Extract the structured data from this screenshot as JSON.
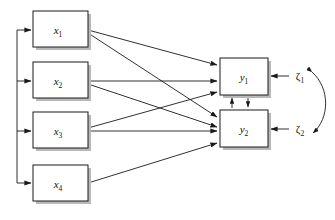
{
  "diagram": {
    "type": "path-diagram",
    "background_color": "#ffffff",
    "line_color": "#1a1a1a",
    "box_fill": "#ffffff",
    "shadow_color": "#b9b9b9"
  },
  "exogenous": {
    "group_label": "exogenous-variables",
    "nodes": [
      {
        "id": "x1",
        "base": "x",
        "subscript": "1",
        "x": 33,
        "y": 11,
        "w": 55,
        "h": 36
      },
      {
        "id": "x2",
        "base": "x",
        "subscript": "2",
        "x": 33,
        "y": 62,
        "w": 55,
        "h": 36
      },
      {
        "id": "x3",
        "base": "x",
        "subscript": "3",
        "x": 33,
        "y": 112,
        "w": 55,
        "h": 36
      },
      {
        "id": "x4",
        "base": "x",
        "subscript": "4",
        "x": 33,
        "y": 165,
        "w": 55,
        "h": 36
      }
    ]
  },
  "endogenous": {
    "group_label": "endogenous-variables",
    "nodes": [
      {
        "id": "y1",
        "base": "y",
        "subscript": "1",
        "x": 220,
        "y": 58,
        "w": 48,
        "h": 37
      },
      {
        "id": "y2",
        "base": "y",
        "subscript": "2",
        "x": 220,
        "y": 110,
        "w": 48,
        "h": 37
      }
    ]
  },
  "disturbances": {
    "group_label": "disturbance-terms",
    "nodes": [
      {
        "id": "zeta1",
        "base": "ζ",
        "subscript": "1",
        "label": "ζ1",
        "x": 300,
        "y": 76
      },
      {
        "id": "zeta2",
        "base": "ζ",
        "subscript": "2",
        "label": "ζ2",
        "x": 300,
        "y": 129
      }
    ]
  },
  "paths": {
    "group_label": "directed-paths",
    "directed": [
      {
        "from": "x1",
        "to": "y1"
      },
      {
        "from": "x1",
        "to": "y2"
      },
      {
        "from": "x2",
        "to": "y1"
      },
      {
        "from": "x2",
        "to": "y2"
      },
      {
        "from": "x3",
        "to": "y1"
      },
      {
        "from": "x3",
        "to": "y2"
      },
      {
        "from": "x4",
        "to": "y2"
      },
      {
        "from": "y1",
        "to": "y2"
      },
      {
        "from": "y2",
        "to": "y1"
      },
      {
        "from": "zeta1",
        "to": "y1"
      },
      {
        "from": "zeta2",
        "to": "y2"
      }
    ],
    "covariance": [
      {
        "between": [
          "zeta1",
          "zeta2"
        ],
        "style": "curved-double-headed"
      }
    ],
    "exogenous_bracket": {
      "label": "exogenous-common-cause-bracket",
      "trunk_x": 17,
      "top_y": 30,
      "bottom_y": 183,
      "targets": [
        "x1",
        "x2",
        "x3",
        "x4"
      ]
    }
  }
}
